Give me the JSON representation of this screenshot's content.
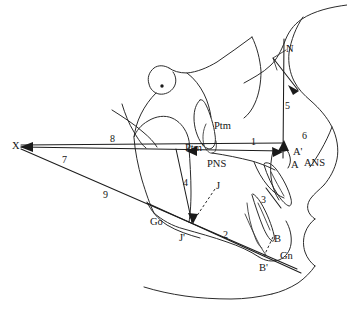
{
  "figure": {
    "name": "cephalometric-tracing",
    "type": "lateral-cephalometric-radiograph-tracing",
    "background_color": "#ffffff",
    "line_color": "#2b2b2b",
    "text_color": "#141414",
    "width": 347,
    "height": 320
  },
  "labels": {
    "landmarks": [
      {
        "id": "X",
        "text": "X",
        "x": 12,
        "y": 141,
        "kind": "point"
      },
      {
        "id": "N",
        "text": "N",
        "x": 286,
        "y": 44,
        "kind": "point"
      },
      {
        "id": "Ptm",
        "text": "Ptm",
        "x": 214,
        "y": 121,
        "kind": "point"
      },
      {
        "id": "Ptmp",
        "text": "Ptm'",
        "x": 185,
        "y": 143,
        "kind": "point"
      },
      {
        "id": "PNS",
        "text": "PNS",
        "x": 207,
        "y": 159,
        "kind": "point"
      },
      {
        "id": "J",
        "text": "J",
        "x": 216,
        "y": 181,
        "kind": "point"
      },
      {
        "id": "Ap",
        "text": "A'",
        "x": 293,
        "y": 147,
        "kind": "point"
      },
      {
        "id": "A",
        "text": "A",
        "x": 291,
        "y": 160,
        "kind": "point"
      },
      {
        "id": "ANS",
        "text": "ANS",
        "x": 304,
        "y": 158,
        "kind": "point"
      },
      {
        "id": "Go",
        "text": "Go",
        "x": 150,
        "y": 217,
        "kind": "point"
      },
      {
        "id": "Jp",
        "text": "J'",
        "x": 179,
        "y": 233,
        "kind": "point"
      },
      {
        "id": "B",
        "text": "B",
        "x": 274,
        "y": 234,
        "kind": "point"
      },
      {
        "id": "Gn",
        "text": "Gn",
        "x": 280,
        "y": 251,
        "kind": "point"
      },
      {
        "id": "Bp",
        "text": "B'",
        "x": 259,
        "y": 263,
        "kind": "point"
      }
    ],
    "measurements": [
      {
        "id": "m1",
        "text": "1",
        "x": 251,
        "y": 137,
        "kind": "number"
      },
      {
        "id": "m2",
        "text": "2",
        "x": 223,
        "y": 230,
        "kind": "number"
      },
      {
        "id": "m3",
        "text": "3",
        "x": 261,
        "y": 195,
        "kind": "number"
      },
      {
        "id": "m4",
        "text": "4",
        "x": 183,
        "y": 178,
        "kind": "number"
      },
      {
        "id": "m5",
        "text": "5",
        "x": 285,
        "y": 101,
        "kind": "number"
      },
      {
        "id": "m6",
        "text": "6",
        "x": 302,
        "y": 131,
        "kind": "number"
      },
      {
        "id": "m7",
        "text": "7",
        "x": 62,
        "y": 155,
        "kind": "number"
      },
      {
        "id": "m8",
        "text": "8",
        "x": 110,
        "y": 134,
        "kind": "number"
      },
      {
        "id": "m9",
        "text": "9",
        "x": 103,
        "y": 190,
        "kind": "number"
      }
    ]
  },
  "geometry": {
    "anatomy": {
      "cranial_base_superior": "M 347 6 C 330 8 312 12 300 20 C 292 25 287 32 284 40 C 280 50 276 58 270 64 C 262 72 250 78 243 82",
      "frontal_nasal_profile": "M 300 19 C 294 28 290 40 288 52 C 287 62 289 72 293 80 C 297 88 303 94 310 100 C 318 107 326 116 331 126 C 336 136 338 148 336 158 C 334 168 329 177 323 184",
      "cranial_base_line": "M 251 38 C 240 46 228 55 216 63 C 206 69 196 73 186 74 C 178 74 172 72 168 69",
      "sella_outline": "M 168 69 C 163 66 157 66 153 69 C 148 73 146 79 148 85 C 149 90 153 94 158 95 C 164 96 170 93 173 88 C 176 83 175 77 172 73",
      "sella_to_anterior": "M 158 95 C 152 100 146 107 142 115 C 138 123 136 131 135 138",
      "sella_dot_cx": 162,
      "sella_dot_cy": 86,
      "sella_dot_r": 1.7,
      "orbital_rim": "M 186 74 C 193 79 199 86 203 94 C 207 102 209 110 210 117",
      "pterygomaxillary_fissure": "M 199 101 C 195 105 193 111 193 118 C 193 127 196 136 201 143 C 204 147 208 149 211 147 C 214 145 215 140 214 134 C 213 125 209 113 205 105 C 203 102 201 100 199 101 Z",
      "ptm_inner": "M 203 122 C 200 128 199 136 201 143 C 203 149 207 152 210 151 C 213 150 214 145 213 139",
      "maxilla_body": "M 135 138 C 137 132 142 126 149 122 C 157 117 166 116 173 119 C 180 122 185 128 188 135 C 190 140 191 145 190 149",
      "zygomatic_arch": "M 116 113 C 126 119 136 126 144 133 C 150 138 155 143 158 148",
      "coronoid_process": "M 124 107 C 127 116 131 126 136 134 C 140 141 144 146 148 149",
      "ramus_posterior": "M 135 139 C 136 152 139 167 143 181 C 147 194 151 206 155 214",
      "ramus_anterior": "M 190 149 C 191 163 192 178 192 193 C 192 207 191 217 190 223",
      "mandible_lower_border": "M 155 214 C 163 221 173 227 185 230 C 199 234 214 238 228 243 C 240 247 251 252 260 258",
      "gonial_curve": "M 148 203 C 152 212 159 220 168 226 C 178 232 190 236 201 239",
      "chin_symphysis": "M 260 258 C 266 262 273 263 280 261 C 287 258 291 252 292 245 C 293 237 291 229 287 222",
      "mandible_inner": "M 246 215 C 250 224 254 233 258 241 C 261 247 264 252 267 256",
      "maxillary_alveolus": "M 255 163 C 258 171 263 180 269 187 C 274 193 280 197 285 199",
      "anterior_nasal_spine": "M 283 146 C 287 149 290 153 291 158 C 292 162 291 166 289 169",
      "maxilla_anterior_wall": "M 274 152 C 272 160 271 169 272 178 C 273 187 276 195 280 201",
      "upper_incisor": "M 265 166 C 268 176 273 187 279 196 C 283 202 287 206 290 207 C 292 207 293 204 292 200 C 290 191 284 179 277 170 C 273 165 269 163 266 164 Z",
      "upper_incisor_inner": "M 272 173 C 276 181 281 190 285 197",
      "lower_incisor": "M 253 196 C 256 206 260 218 264 228 C 267 235 270 240 273 242 C 275 243 276 240 275 236 C 273 227 268 214 262 204 C 259 199 256 196 254 195 Z",
      "lower_incisor_inner": "M 259 204 C 263 212 267 222 271 231",
      "second_lower_tooth": "M 248 204 C 249 215 252 228 256 238 C 258 244 261 248 263 249",
      "lip_profile_upper": "M 323 184 C 318 189 313 193 310 197 C 307 201 306 205 307 209 C 308 213 311 216 314 218",
      "lip_profile_lower": "M 314 218 C 310 221 306 226 304 232 C 302 238 302 245 304 251 C 306 257 310 262 314 265",
      "chin_profile": "M 314 265 C 310 271 304 277 297 282 C 289 287 280 291 271 293",
      "soft_tissue_neck": "M 271 293 C 258 296 244 298 230 298 C 214 298 198 297 184 295 C 170 293 156 290 143 286",
      "nasal_dorsum": "M 331 126 C 328 134 324 142 320 149 C 316 156 312 162 309 166",
      "palate_line": "M 211 152 C 225 154 240 157 252 160 C 262 163 270 166 276 169",
      "pharynx": "M 251 38 C 256 48 259 60 260 72 C 260 84 258 95 254 104 C 251 111 247 116 243 119"
    },
    "measure_lines": {
      "x_to_ptm_ans": "M 20 147 L 272 152",
      "ptm_to_ans_upper": "M 20 146 L 280 144",
      "x_to_gn_lower": "M 20 148 L 296 268",
      "ptm_horizontal": "M 186 151 L 285 152",
      "n_to_a_vertical": "M 284 40 L 283 157",
      "n_diagonal": "M 272 57 L 297 89",
      "n_bracket": "M 272 57 L 282 52",
      "ramus_measure_4": "M 175 150 L 191 224",
      "j_to_jp_axis": "M 191 151 L 191 224",
      "go_gn_plane": "M 148 204 L 300 272"
    },
    "dashed": {
      "j_to_jp": "M 214 190 L 193 221",
      "b_to_bp": "M 272 238 L 263 257"
    },
    "arrow_heads": [
      {
        "id": "arrow-x",
        "points": "20,147 32,143 32,151",
        "rotate": 0
      },
      {
        "id": "arrow-ans-right",
        "points": "282,152 271,148 272,156"
      },
      {
        "id": "arrow-a-up",
        "points": "283,141 278,151 288,151"
      },
      {
        "id": "arrow-ptm-left",
        "points": "186,151 196,147 196,155"
      },
      {
        "id": "arrow-jp-down",
        "points": "192,224 188,214 197,214"
      },
      {
        "id": "arrow-n-down",
        "points": "297,89 287,84 292,94"
      }
    ]
  }
}
